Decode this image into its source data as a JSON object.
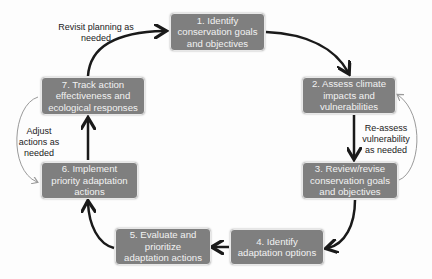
{
  "diagram": {
    "type": "cycle",
    "colors": {
      "box_fill": "#7f7f7f",
      "box_text": "#f2f2f2",
      "main_arrow": "#1a1a1a",
      "feedback_arrow": "#9a9a9a"
    },
    "steps": [
      {
        "id": 1,
        "label": "1. Identify\nconservation goals\nand objectives"
      },
      {
        "id": 2,
        "label": "2. Assess climate\nimpacts and\nvulnerabilities"
      },
      {
        "id": 3,
        "label": "3. Review/revise\nconservation goals\nand objectives"
      },
      {
        "id": 4,
        "label": "4. Identify\nadaptation options"
      },
      {
        "id": 5,
        "label": "5. Evaluate and\nprioritize\nadaptation actions"
      },
      {
        "id": 6,
        "label": "6. Implement\npriority adaptation\nactions"
      },
      {
        "id": 7,
        "label": "7. Track action\neffectiveness and\necological responses"
      }
    ],
    "notes": {
      "revisit": "Revisit planning as\nneeded",
      "reassess": "Re-assess\nvulnerability\nas needed",
      "adjust": "Adjust\nactions as\nneeded"
    }
  }
}
